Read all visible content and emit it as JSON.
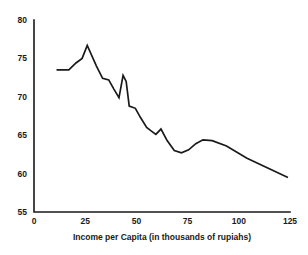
{
  "chart_data": {
    "type": "line",
    "title": "",
    "subtitle": "",
    "xlabel": "Income per Capita (in thousands of rupiahs)",
    "ylabel": "",
    "xlim": [
      0,
      125
    ],
    "ylim": [
      55,
      80
    ],
    "xticks": [
      0,
      25,
      50,
      75,
      100,
      125
    ],
    "yticks": [
      55,
      60,
      65,
      70,
      75,
      80
    ],
    "xtick_labels": [
      "0",
      "25",
      "50",
      "75",
      "100",
      "125"
    ],
    "ytick_labels": [
      "55",
      "60",
      "65",
      "70",
      "75",
      "80"
    ],
    "grid": false,
    "legend": null,
    "legend_position": "none",
    "annotations": [],
    "series": [
      {
        "name": "",
        "color": "#1a1a1a",
        "points": [
          [
            11.0,
            73.5
          ],
          [
            17.0,
            73.5
          ],
          [
            20.5,
            74.4
          ],
          [
            23.5,
            75.0
          ],
          [
            26.0,
            76.7
          ],
          [
            30.5,
            74.0
          ],
          [
            33.5,
            72.4
          ],
          [
            36.5,
            72.2
          ],
          [
            39.0,
            71.0
          ],
          [
            41.5,
            69.9
          ],
          [
            43.5,
            72.8
          ],
          [
            45.0,
            72.0
          ],
          [
            46.5,
            68.8
          ],
          [
            49.5,
            68.5
          ],
          [
            52.0,
            67.3
          ],
          [
            55.0,
            66.0
          ],
          [
            57.5,
            65.5
          ],
          [
            59.5,
            65.1
          ],
          [
            62.0,
            65.8
          ],
          [
            65.0,
            64.3
          ],
          [
            68.5,
            63.0
          ],
          [
            72.0,
            62.7
          ],
          [
            75.5,
            63.1
          ],
          [
            79.0,
            63.9
          ],
          [
            82.5,
            64.4
          ],
          [
            87.0,
            64.3
          ],
          [
            94.0,
            63.6
          ],
          [
            104.0,
            62.0
          ],
          [
            124.0,
            59.5
          ]
        ]
      }
    ]
  },
  "axis": {
    "x_title": "Income per Capita (in thousands of rupiahs)"
  }
}
